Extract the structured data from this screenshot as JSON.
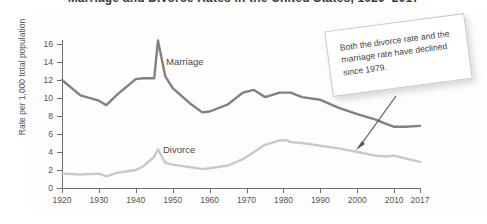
{
  "title": "Marriage and Divorce Rates in the United States, 1920–2017",
  "axes": {
    "y_title": "Rate per 1,000 total population",
    "y_ticks": [
      0,
      2,
      4,
      6,
      8,
      10,
      12,
      14,
      16
    ],
    "x_ticks": [
      "1920",
      "1930",
      "1940",
      "1950",
      "1960",
      "1970",
      "1980",
      "1990",
      "2000",
      "2010",
      "2017"
    ]
  },
  "series_labels": {
    "marriage": "Marriage",
    "divorce": "Divorce"
  },
  "callout": {
    "text": "Both the divorce rate and the marriage rate have declined since 1979."
  },
  "colors": {
    "marriage_line": "#808080",
    "divorce_line": "#c9c9c9",
    "axis": "#6e6e6e",
    "text": "#555555",
    "callout_border": "#c9c9c9"
  },
  "chart_data": {
    "type": "line",
    "title": "Marriage and Divorce Rates in the United States, 1920–2017",
    "xlabel": "",
    "ylabel": "Rate per 1,000 total population",
    "xlim": [
      1920,
      2017
    ],
    "ylim": [
      0,
      16
    ],
    "grid": false,
    "legend": "inline-labels",
    "x": [
      1920,
      1925,
      1930,
      1932,
      1935,
      1940,
      1942,
      1945,
      1946,
      1948,
      1950,
      1955,
      1958,
      1960,
      1965,
      1969,
      1972,
      1975,
      1979,
      1981,
      1982,
      1985,
      1990,
      1995,
      2000,
      2005,
      2008,
      2010,
      2013,
      2017
    ],
    "series": [
      {
        "name": "Marriage",
        "color": "#808080",
        "values": [
          12.0,
          10.3,
          9.7,
          9.2,
          10.4,
          12.1,
          12.2,
          12.2,
          16.4,
          12.4,
          11.1,
          9.3,
          8.4,
          8.5,
          9.3,
          10.6,
          10.9,
          10.1,
          10.6,
          10.6,
          10.6,
          10.1,
          9.8,
          8.9,
          8.2,
          7.6,
          7.1,
          6.8,
          6.8,
          6.9
        ]
      },
      {
        "name": "Divorce",
        "color": "#c9c9c9",
        "values": [
          1.6,
          1.5,
          1.6,
          1.3,
          1.7,
          2.0,
          2.4,
          3.5,
          4.3,
          2.8,
          2.6,
          2.3,
          2.1,
          2.2,
          2.5,
          3.2,
          4.0,
          4.8,
          5.3,
          5.3,
          5.1,
          5.0,
          4.7,
          4.4,
          4.0,
          3.6,
          3.5,
          3.6,
          3.3,
          2.9
        ]
      }
    ],
    "annotations": [
      {
        "text": "Both the divorce rate and the marriage rate have declined since 1979.",
        "points_to_year": 2005,
        "points_to_value": 3.55
      }
    ]
  }
}
